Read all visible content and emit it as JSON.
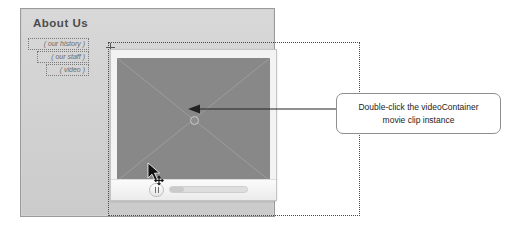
{
  "stage": {
    "page_title": "About Us",
    "nav": {
      "items": [
        {
          "label": "( our history )",
          "name": "nav-item-our-history"
        },
        {
          "label": "( our staff )",
          "name": "nav-item-our-staff"
        },
        {
          "label": "( video )",
          "name": "nav-item-video"
        }
      ]
    },
    "video_container": {
      "instance_name": "videoContainer",
      "symbol_placeholder": "cross-placeholder",
      "registration_point": "center",
      "controls": {
        "pause_icon": "pause-icon",
        "progress_percent": 18
      }
    },
    "cursor": {
      "icon": "arrow-move-cursor"
    }
  },
  "callout": {
    "line1": "Double-click the videoContainer",
    "line2": "movie clip instance",
    "pointer": "left-arrow"
  },
  "colors": {
    "stage_background": "#d2d2d2",
    "stage_border": "#9a9a9a",
    "video_fill": "#888888",
    "player_chrome": "#f3f3f3",
    "title_text": "#4c4c4c",
    "nav_text": "#6a6a6a",
    "callout_border": "#8e8e8e",
    "callout_text": "#1d1d1d",
    "arrow": "#222222"
  }
}
